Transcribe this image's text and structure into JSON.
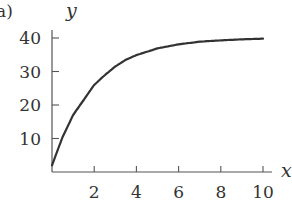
{
  "panel_label": "a)",
  "chart_data": {
    "type": "line",
    "title": "",
    "xlabel": "x",
    "ylabel": "y",
    "xlim": [
      0,
      10
    ],
    "ylim": [
      0,
      40
    ],
    "grid": false,
    "legend": null,
    "x_ticks": [
      2,
      4,
      6,
      8,
      10
    ],
    "y_ticks": [
      10,
      20,
      30,
      40
    ],
    "x_tick_labels": [
      "2",
      "4",
      "6",
      "8",
      "10"
    ],
    "y_tick_labels": [
      "10",
      "20",
      "30",
      "40"
    ],
    "series": [
      {
        "name": "y(x)",
        "color": "#333333",
        "x": [
          0,
          0.5,
          1,
          1.5,
          2,
          2.5,
          3,
          3.5,
          4,
          5,
          6,
          7,
          8,
          9,
          10
        ],
        "values": [
          2,
          10.4,
          17.0,
          21.5,
          26.0,
          28.9,
          31.5,
          33.5,
          34.9,
          36.9,
          38.1,
          38.9,
          39.3,
          39.6,
          39.8
        ]
      }
    ]
  }
}
